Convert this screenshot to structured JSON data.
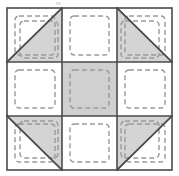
{
  "figure": {
    "type": "pieced quilt block",
    "grid_rows": 3,
    "grid_cols": 3,
    "width_px": 179,
    "height_px": 176
  },
  "geometry": {
    "outer_x": 7,
    "outer_y": 8,
    "outer_w": 165,
    "outer_h": 162,
    "cell_w": 55,
    "cell_h": 54,
    "grid_line_1_x": 62,
    "grid_line_2_x": 117,
    "grid_line_1_y": 62,
    "grid_line_2_y": 116,
    "dash_inset": 9,
    "dash_corner_radius": 4
  },
  "colors": {
    "background": "#ffffff",
    "patch_white": "#ffffff",
    "patch_gray": "#d4d4d4",
    "patch_gray_center": "#d0d0d0",
    "outline": "#4a4a4a",
    "diagonal_line": "#4a4a4a",
    "dashed_stitch": "#9a9a9a",
    "artifact": "#dcdcdc"
  },
  "strokes": {
    "outline_width": 1.6,
    "diagonal_width": 1.8,
    "dash_width": 1.4,
    "dash_pattern": "5,3"
  },
  "cells": [
    {
      "id": "cell-top-left",
      "row": 0,
      "col": 0,
      "fill": "white",
      "diagonal": "anti",
      "shaded_half": "lower-right",
      "dashed_squares": 2
    },
    {
      "id": "cell-top-center",
      "row": 0,
      "col": 1,
      "fill": "white",
      "diagonal": "none",
      "shaded_half": "none",
      "dashed_squares": 1
    },
    {
      "id": "cell-top-right",
      "row": 0,
      "col": 2,
      "fill": "white",
      "diagonal": "main",
      "shaded_half": "lower-left",
      "dashed_squares": 2
    },
    {
      "id": "cell-middle-left",
      "row": 1,
      "col": 0,
      "fill": "white",
      "diagonal": "none",
      "shaded_half": "none",
      "dashed_squares": 1
    },
    {
      "id": "cell-center",
      "row": 1,
      "col": 1,
      "fill": "gray",
      "diagonal": "none",
      "shaded_half": "full",
      "dashed_squares": 1
    },
    {
      "id": "cell-middle-right",
      "row": 1,
      "col": 2,
      "fill": "white",
      "diagonal": "none",
      "shaded_half": "none",
      "dashed_squares": 1
    },
    {
      "id": "cell-bottom-left",
      "row": 2,
      "col": 0,
      "fill": "white",
      "diagonal": "main",
      "shaded_half": "upper-right",
      "dashed_squares": 2
    },
    {
      "id": "cell-bottom-center",
      "row": 2,
      "col": 1,
      "fill": "white",
      "diagonal": "none",
      "shaded_half": "none",
      "dashed_squares": 1
    },
    {
      "id": "cell-bottom-right",
      "row": 2,
      "col": 2,
      "fill": "white",
      "diagonal": "anti",
      "shaded_half": "upper-left",
      "dashed_squares": 2
    }
  ],
  "artifact": {
    "label": "scan-speck",
    "x": 56,
    "y": 2
  }
}
